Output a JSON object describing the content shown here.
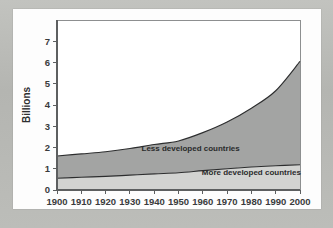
{
  "figure": {
    "background_color": "#b9bab6",
    "sheet_color": "#fdfdfd",
    "name": "world-population-stacked-area-figure"
  },
  "chart_data": {
    "type": "area",
    "stacked": true,
    "title": "",
    "xlabel": "",
    "ylabel": "Billions",
    "xlim": [
      1900,
      2000
    ],
    "ylim": [
      0,
      8
    ],
    "grid": false,
    "legend_position": "inline-annotation",
    "x": [
      1900,
      1910,
      1920,
      1930,
      1940,
      1950,
      1960,
      1970,
      1980,
      1990,
      2000
    ],
    "xticklabels": [
      "1900",
      "1910",
      "1920",
      "1930",
      "1940",
      "1950",
      "1960",
      "1970",
      "1980",
      "1990",
      "2000"
    ],
    "yticks": [
      0,
      1,
      2,
      3,
      4,
      5,
      6,
      7
    ],
    "yticklabels": [
      "0",
      "1",
      "2",
      "3",
      "4",
      "5",
      "6",
      "7"
    ],
    "series": [
      {
        "name": "More developed countries",
        "label": "More developed countries",
        "color": "#d2d3d1",
        "values": [
          0.55,
          0.6,
          0.64,
          0.7,
          0.76,
          0.81,
          0.91,
          1.0,
          1.08,
          1.14,
          1.19
        ]
      },
      {
        "name": "Less developed countries",
        "label": "Less developed countries",
        "color": "#a3a4a3",
        "values": [
          1.05,
          1.1,
          1.16,
          1.25,
          1.38,
          1.5,
          1.79,
          2.2,
          2.77,
          3.53,
          4.86
        ]
      }
    ],
    "totals": [
      1.6,
      1.7,
      1.8,
      1.95,
      2.14,
      2.31,
      2.7,
      3.2,
      3.85,
      4.67,
      6.05
    ],
    "annotations": [
      {
        "text": "Less developed countries",
        "x": 1955,
        "y": 1.85
      },
      {
        "text": "More developed countries",
        "x": 1980,
        "y": 0.72
      }
    ]
  }
}
